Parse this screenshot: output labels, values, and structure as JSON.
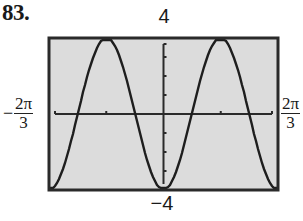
{
  "problem_label": "83.",
  "axis_labels": {
    "y_max": "4",
    "y_min": "−4",
    "x_min_sign": "−",
    "x_min_num": "2π",
    "x_min_den": "3",
    "x_max_num": "2π",
    "x_max_den": "3"
  },
  "colors": {
    "screen_bg": "#dcdcdc",
    "frame": "#2a2a2a",
    "curve": "#1e1e1e",
    "axes": "#2a2a2a"
  },
  "chart_data": {
    "type": "line",
    "title": "",
    "function": "y = -4 cos(3x)",
    "xlabel": "",
    "ylabel": "",
    "xlim": [
      -2.0944,
      2.0944
    ],
    "ylim": [
      -4,
      4
    ],
    "x_tick_labels": [
      "-2π/3",
      "2π/3"
    ],
    "y_tick_labels": [
      "-4",
      "4"
    ],
    "x_ticks": [
      -1.0472,
      1.0472
    ],
    "y_ticks": [
      -3,
      -2,
      -1,
      1,
      2,
      3
    ],
    "grid": false,
    "legend": null,
    "series": [
      {
        "name": "y = -4cos(3x)",
        "x": [
          -2.0944,
          -1.8326,
          -1.5708,
          -1.309,
          -1.0472,
          -0.7854,
          -0.5236,
          -0.2618,
          0,
          0.2618,
          0.5236,
          0.7854,
          1.0472,
          1.309,
          1.5708,
          1.8326,
          2.0944
        ],
        "values": [
          -4,
          -2.83,
          0,
          2.83,
          4,
          2.83,
          0,
          -2.83,
          -4,
          -2.83,
          0,
          2.83,
          4,
          2.83,
          0,
          -2.83,
          -4
        ]
      }
    ]
  }
}
